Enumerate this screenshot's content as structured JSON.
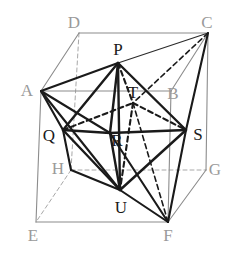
{
  "figure": {
    "width": 233,
    "height": 254,
    "background": "#ffffff"
  },
  "colors": {
    "cube_edge_visible": "#8c8c8c",
    "cube_edge_hidden": "#a8a8a8",
    "solid_edge": "#1a1a1a",
    "thin_edge": "#2b2b2b",
    "hidden_edge": "#1a1a1a",
    "label_cube": "#9a9a9a",
    "label_inner": "#1a1a1a"
  },
  "cube": {
    "name": "cube-ABCDEFGH",
    "vertices": [
      {
        "id": "A",
        "label": "A",
        "x": 41,
        "y": 91,
        "label_x": 27,
        "label_y": 90,
        "tone": "light"
      },
      {
        "id": "B",
        "label": "B",
        "x": 171,
        "y": 91,
        "label_x": 173,
        "label_y": 93,
        "tone": "light"
      },
      {
        "id": "C",
        "label": "C",
        "x": 208,
        "y": 33,
        "label_x": 207,
        "label_y": 22,
        "tone": "light"
      },
      {
        "id": "D",
        "label": "D",
        "x": 79,
        "y": 33,
        "label_x": 74,
        "label_y": 22,
        "tone": "light"
      },
      {
        "id": "E",
        "label": "E",
        "x": 36,
        "y": 222,
        "label_x": 33,
        "label_y": 235,
        "tone": "light"
      },
      {
        "id": "F",
        "label": "F",
        "x": 168,
        "y": 222,
        "label_x": 168,
        "label_y": 235,
        "tone": "light"
      },
      {
        "id": "G",
        "label": "G",
        "x": 206,
        "y": 170,
        "label_x": 215,
        "label_y": 169,
        "tone": "light"
      },
      {
        "id": "H",
        "label": "H",
        "x": 71,
        "y": 170,
        "label_x": 58,
        "label_y": 168,
        "tone": "light"
      }
    ],
    "visible_edges": [
      [
        "A",
        "B"
      ],
      [
        "B",
        "C"
      ],
      [
        "C",
        "D"
      ],
      [
        "D",
        "A"
      ],
      [
        "A",
        "E"
      ],
      [
        "B",
        "F"
      ],
      [
        "C",
        "G"
      ],
      [
        "E",
        "F"
      ],
      [
        "F",
        "G"
      ]
    ],
    "hidden_edges": [
      [
        "D",
        "H"
      ],
      [
        "H",
        "E"
      ],
      [
        "H",
        "G"
      ]
    ]
  },
  "octahedron": {
    "name": "octahedron-PQRSTU",
    "vertices": [
      {
        "id": "P",
        "label": "P",
        "x": 118,
        "y": 63,
        "label_x": 118,
        "label_y": 49,
        "tone": "dark"
      },
      {
        "id": "Q",
        "label": "Q",
        "x": 63,
        "y": 130,
        "label_x": 49,
        "label_y": 135,
        "tone": "dark"
      },
      {
        "id": "R",
        "label": "R",
        "x": 110,
        "y": 133,
        "label_x": 117,
        "label_y": 140,
        "tone": "dark"
      },
      {
        "id": "S",
        "label": "S",
        "x": 186,
        "y": 130,
        "label_x": 198,
        "label_y": 134,
        "tone": "dark"
      },
      {
        "id": "T",
        "label": "T",
        "x": 133,
        "y": 103,
        "label_x": 133,
        "label_y": 92,
        "tone": "dark"
      },
      {
        "id": "U",
        "label": "U",
        "x": 120,
        "y": 190,
        "label_x": 121,
        "label_y": 207,
        "tone": "dark"
      }
    ],
    "solid_edges": [
      [
        "P",
        "Q"
      ],
      [
        "P",
        "R"
      ],
      [
        "P",
        "S"
      ],
      [
        "P",
        "U"
      ],
      [
        "Q",
        "R"
      ],
      [
        "R",
        "S"
      ],
      [
        "Q",
        "U"
      ],
      [
        "R",
        "U"
      ],
      [
        "S",
        "U"
      ]
    ],
    "hidden_edges": [
      [
        "Q",
        "T"
      ],
      [
        "T",
        "S"
      ],
      [
        "T",
        "U"
      ],
      [
        "P",
        "T"
      ]
    ]
  },
  "connections": {
    "name": "cube-to-octahedron-lines",
    "solid": [
      [
        "A",
        "P"
      ],
      [
        "A",
        "Q"
      ],
      [
        "A",
        "R"
      ],
      [
        "A",
        "U"
      ],
      [
        "C",
        "S"
      ],
      [
        "C",
        "P"
      ],
      [
        "F",
        "S"
      ],
      [
        "F",
        "U"
      ],
      [
        "F",
        "R"
      ],
      [
        "Q",
        "H"
      ],
      [
        "H",
        "U"
      ]
    ],
    "hidden": [
      [
        "C",
        "T"
      ],
      [
        "T",
        "F"
      ]
    ]
  },
  "labels": {
    "cube_vertices": [
      "A",
      "B",
      "C",
      "D",
      "E",
      "F",
      "G",
      "H"
    ],
    "inner_vertices": [
      "P",
      "Q",
      "R",
      "S",
      "T",
      "U"
    ]
  }
}
